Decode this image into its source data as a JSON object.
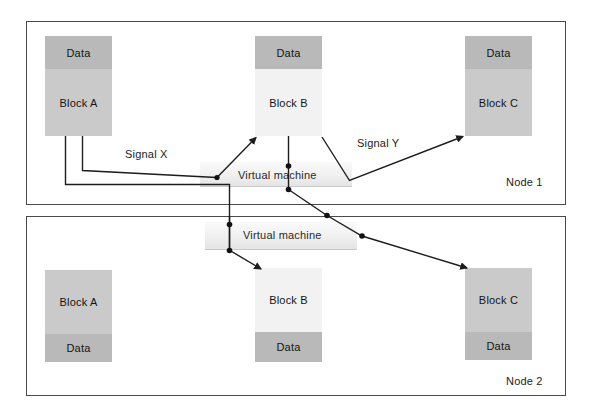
{
  "diagram": {
    "nodes": [
      {
        "id": "node1",
        "label": "Node 1",
        "virtual_machine_label": "Virtual machine",
        "data_band_position": "top",
        "blocks": [
          {
            "name": "Block A",
            "data_label": "Data"
          },
          {
            "name": "Block B",
            "data_label": "Data"
          },
          {
            "name": "Block C",
            "data_label": "Data"
          }
        ]
      },
      {
        "id": "node2",
        "label": "Node 2",
        "virtual_machine_label": "Virtual machine",
        "data_band_position": "bottom",
        "blocks": [
          {
            "name": "Block A",
            "data_label": "Data"
          },
          {
            "name": "Block B",
            "data_label": "Data"
          },
          {
            "name": "Block C",
            "data_label": "Data"
          }
        ]
      }
    ],
    "signals": [
      {
        "id": "signal-x",
        "label": "Signal X"
      },
      {
        "id": "signal-y",
        "label": "Signal Y"
      }
    ],
    "colors": {
      "frame_border": "#4a4a4a",
      "data_band": "#b9b9b9",
      "block_body_mid": "#cacaca",
      "block_body_light": "#f2f2f2",
      "vm_band": "#f0f0f0",
      "wire": "#1d1d1d",
      "text": "#1b1b1b",
      "background": "#ffffff"
    }
  }
}
